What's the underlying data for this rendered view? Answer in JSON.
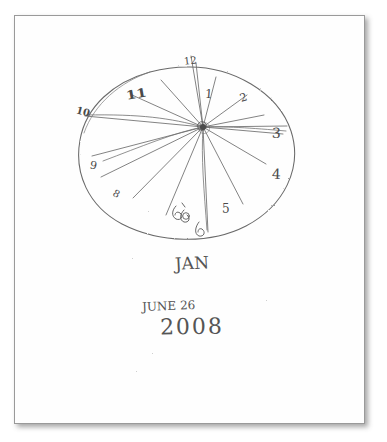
{
  "document": {
    "kind": "scanned-sheet",
    "media": "white paper",
    "ink_color": "#4a4a4a",
    "paper_color": "#fefefe",
    "border_color": "#9a9a9a"
  },
  "drawing": {
    "title": "clock drawing",
    "shape": "ellipse",
    "ellipse": {
      "cx": 188,
      "cy": 152,
      "rx": 106,
      "ry": 85,
      "rotation_deg": -8
    },
    "hub": {
      "cx": 203,
      "cy": 127
    },
    "hand_count": 14,
    "hands": [
      {
        "name": "hand-1",
        "angle_deg": -80,
        "length": 72
      },
      {
        "name": "hand-2",
        "angle_deg": -64,
        "length": 62
      },
      {
        "name": "hand-3",
        "angle_deg": -38,
        "length": 60
      },
      {
        "name": "hand-4",
        "angle_deg": -12,
        "length": 92
      },
      {
        "name": "hand-5",
        "angle_deg": -3,
        "length": 88
      },
      {
        "name": "hand-6",
        "angle_deg": 8,
        "length": 84
      },
      {
        "name": "hand-7",
        "angle_deg": 31,
        "length": 80
      },
      {
        "name": "hand-8",
        "angle_deg": 58,
        "length": 76
      },
      {
        "name": "hand-9",
        "angle_deg": 86,
        "length": 96
      },
      {
        "name": "hand-10",
        "angle_deg": 112,
        "length": 80
      },
      {
        "name": "hand-11",
        "angle_deg": 141,
        "length": 78
      },
      {
        "name": "hand-12",
        "angle_deg": 163,
        "length": 74
      },
      {
        "name": "hand-13",
        "angle_deg": 178,
        "length": 108
      },
      {
        "name": "hand-14",
        "angle_deg": 207,
        "length": 92
      },
      {
        "name": "hand-15",
        "angle_deg": 232,
        "length": 86
      }
    ]
  },
  "clock_numbers": [
    {
      "id": "num-12",
      "label": "12",
      "x": 184,
      "y": 56,
      "rotate": -6
    },
    {
      "id": "num-1",
      "label": "1",
      "x": 205,
      "y": 88,
      "rotate": 4
    },
    {
      "id": "num-2",
      "label": "2",
      "x": 240,
      "y": 92,
      "rotate": -18
    },
    {
      "id": "num-3",
      "label": "3",
      "x": 272,
      "y": 126,
      "rotate": 2
    },
    {
      "id": "num-4",
      "label": "4",
      "x": 272,
      "y": 167,
      "rotate": 2
    },
    {
      "id": "num-5",
      "label": "5",
      "x": 222,
      "y": 203,
      "rotate": 0
    },
    {
      "id": "num-6",
      "label": "6",
      "x": 198,
      "y": 231,
      "rotate": 6
    },
    {
      "id": "num-6b",
      "label": "6",
      "x": 178,
      "y": 215,
      "rotate": -8
    },
    {
      "id": "num-7",
      "label": "7",
      "x": 172,
      "y": 209,
      "rotate": 20
    },
    {
      "id": "num-8",
      "label": "8",
      "x": 113,
      "y": 189,
      "rotate": 28
    },
    {
      "id": "num-9",
      "label": "9",
      "x": 90,
      "y": 160,
      "rotate": 12
    },
    {
      "id": "num-10",
      "label": "10",
      "x": 76,
      "y": 107,
      "rotate": 14
    },
    {
      "id": "num-11",
      "label": "11",
      "x": 128,
      "y": 88,
      "rotate": -10
    }
  ],
  "handwriting": {
    "signature": "JAN",
    "date_month_day": "JUNE 26",
    "date_year": "2008"
  },
  "specks": [
    {
      "x": 132,
      "y": 258
    },
    {
      "x": 266,
      "y": 300
    },
    {
      "x": 152,
      "y": 353
    },
    {
      "x": 136,
      "y": 371
    },
    {
      "x": 84,
      "y": 130
    },
    {
      "x": 260,
      "y": 88
    },
    {
      "x": 148,
      "y": 211
    }
  ]
}
